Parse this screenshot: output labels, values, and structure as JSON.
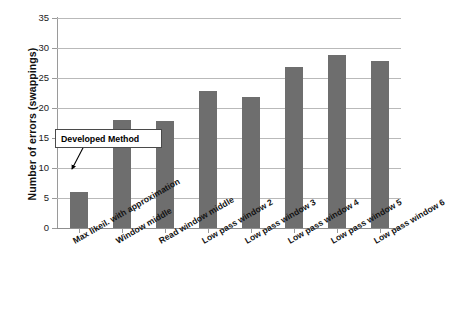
{
  "chart_data": {
    "type": "bar",
    "title": "",
    "xlabel": "",
    "ylabel": "Number of errors  (swappings)",
    "ylim": [
      0,
      35
    ],
    "yticks": [
      0,
      5,
      10,
      15,
      20,
      25,
      30,
      35
    ],
    "ytick_labels": [
      "0",
      "5",
      "10",
      "15",
      "20",
      "25",
      "30",
      "35"
    ],
    "grid": true,
    "legend": "none",
    "bar_color": "#6e6e6e",
    "categories": [
      "Max likeil. with approximation",
      "Window middle",
      "Read window middle",
      "Low pass window 2",
      "Low pass window 3",
      "Low pass window 4",
      "Low pass window 5",
      "Low pass window 6"
    ],
    "values": [
      6,
      18,
      17.9,
      22.9,
      21.8,
      26.8,
      28.8,
      27.8
    ],
    "annotations": [
      {
        "text": "Developed Method",
        "points_to_category": "Max likeil. with approximation"
      }
    ]
  }
}
